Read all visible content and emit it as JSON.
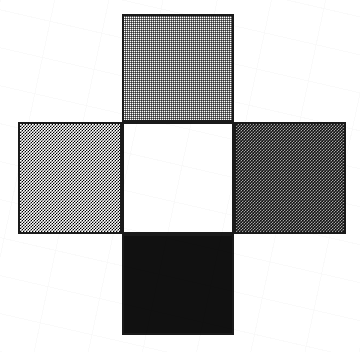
{
  "figure": {
    "canvas": {
      "width": 360,
      "height": 352,
      "background_color": "#ffffff"
    },
    "square_size_px": 112,
    "squares": [
      {
        "name": "top-square",
        "position": "top",
        "shade_label": "light gray",
        "fill_style": "light-dither",
        "fill_color": "#b4b4b4",
        "outline_color": "#1a1a1a",
        "x": 122,
        "y": 14,
        "width": 112,
        "height": 108
      },
      {
        "name": "left-square",
        "position": "left",
        "shade_label": "medium gray",
        "fill_style": "medium-dither",
        "fill_color": "#8c8c8c",
        "outline_color": "#1a1a1a",
        "x": 18,
        "y": 122,
        "width": 104,
        "height": 112
      },
      {
        "name": "center-square",
        "position": "center",
        "shade_label": "white",
        "fill_style": "solid",
        "fill_color": "#ffffff",
        "outline_color": "#1a1a1a",
        "x": 122,
        "y": 122,
        "width": 112,
        "height": 112
      },
      {
        "name": "right-square",
        "position": "right",
        "shade_label": "dark gray",
        "fill_style": "dark-dither",
        "fill_color": "#3c3c3c",
        "outline_color": "#1a1a1a",
        "x": 234,
        "y": 122,
        "width": 112,
        "height": 112
      },
      {
        "name": "bottom-square",
        "position": "bottom",
        "shade_label": "black",
        "fill_style": "solid",
        "fill_color": "#111111",
        "outline_color": "#1a1a1a",
        "x": 122,
        "y": 234,
        "width": 112,
        "height": 101
      }
    ]
  }
}
